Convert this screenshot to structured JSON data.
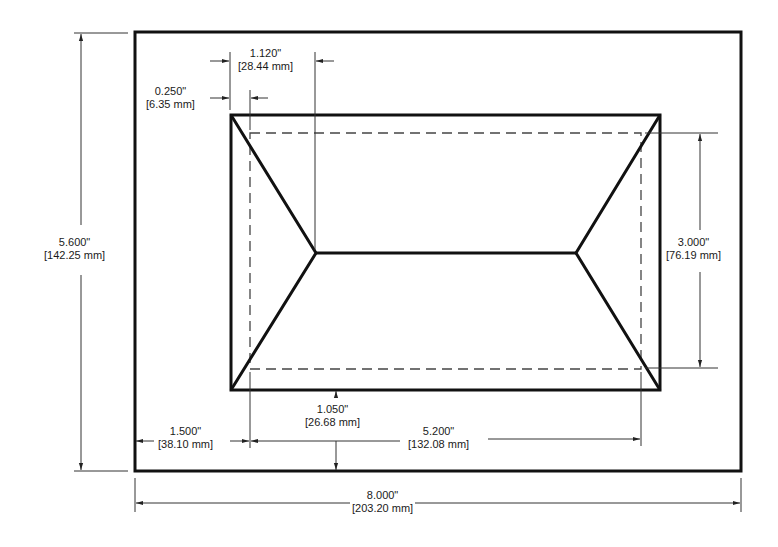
{
  "drawing": {
    "title": "Panel cutout dimension drawing",
    "stroke_color": "#111111",
    "dimension_color": "#333333",
    "background": "#ffffff"
  },
  "dimensions": {
    "overall_height": {
      "inches": "5.600\"",
      "mm": "[142.25 mm]"
    },
    "overall_width": {
      "inches": "8.000\"",
      "mm": "[203.20 mm]"
    },
    "bevel_width": {
      "inches": "1.120\"",
      "mm": "[28.44 mm]"
    },
    "frame_offset": {
      "inches": "0.250\"",
      "mm": "[6.35 mm]"
    },
    "opening_height": {
      "inches": "3.000\"",
      "mm": "[76.19 mm]"
    },
    "left_margin": {
      "inches": "1.500\"",
      "mm": "[38.10 mm]"
    },
    "bottom_margin": {
      "inches": "1.050\"",
      "mm": "[26.68 mm]"
    },
    "opening_width": {
      "inches": "5.200\"",
      "mm": "[132.08 mm]"
    }
  }
}
